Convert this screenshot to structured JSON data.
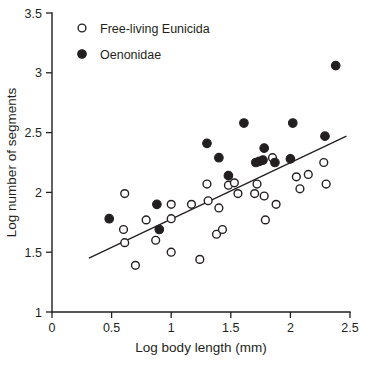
{
  "chart_data": {
    "type": "scatter",
    "title": "",
    "xlabel": "Log body length (mm)",
    "ylabel": "Log number of segments",
    "xlim": [
      0,
      2.5
    ],
    "ylim": [
      1,
      3.5
    ],
    "xticks": [
      "0",
      "0.5",
      "1",
      "1.5",
      "2",
      "2.5"
    ],
    "xtick_values": [
      0,
      0.5,
      1,
      1.5,
      2,
      2.5
    ],
    "yticks": [
      "1",
      "1.5",
      "2",
      "2.5",
      "3",
      "3.5"
    ],
    "ytick_values": [
      1,
      1.5,
      2,
      2.5,
      3,
      3.5
    ],
    "grid": false,
    "legend_position": "top-left",
    "legend": [
      {
        "label": "Free-living Eunicida",
        "marker": "open-circle"
      },
      {
        "label": "Oenonidae",
        "marker": "filled-circle"
      }
    ],
    "series": [
      {
        "name": "Free-living Eunicida",
        "marker": "open-circle",
        "points": [
          [
            0.61,
            1.99
          ],
          [
            0.6,
            1.69
          ],
          [
            0.61,
            1.58
          ],
          [
            0.7,
            1.39
          ],
          [
            0.79,
            1.77
          ],
          [
            0.87,
            1.6
          ],
          [
            1.0,
            1.9
          ],
          [
            1.0,
            1.78
          ],
          [
            1.0,
            1.5
          ],
          [
            1.17,
            1.9
          ],
          [
            1.24,
            1.44
          ],
          [
            1.3,
            2.07
          ],
          [
            1.31,
            1.93
          ],
          [
            1.38,
            1.65
          ],
          [
            1.4,
            1.87
          ],
          [
            1.43,
            1.69
          ],
          [
            1.48,
            2.06
          ],
          [
            1.53,
            2.08
          ],
          [
            1.56,
            1.99
          ],
          [
            1.7,
            1.99
          ],
          [
            1.72,
            2.07
          ],
          [
            1.78,
            1.97
          ],
          [
            1.79,
            1.77
          ],
          [
            1.85,
            2.29
          ],
          [
            1.88,
            1.9
          ],
          [
            2.05,
            2.13
          ],
          [
            2.08,
            2.03
          ],
          [
            2.15,
            2.15
          ],
          [
            2.28,
            2.25
          ],
          [
            2.3,
            2.07
          ]
        ]
      },
      {
        "name": "Oenonidae",
        "marker": "filled-circle",
        "points": [
          [
            0.48,
            1.78
          ],
          [
            0.88,
            1.9
          ],
          [
            0.9,
            1.69
          ],
          [
            1.3,
            2.41
          ],
          [
            1.4,
            2.29
          ],
          [
            1.48,
            2.14
          ],
          [
            1.61,
            2.58
          ],
          [
            1.71,
            2.25
          ],
          [
            1.74,
            2.26
          ],
          [
            1.77,
            2.27
          ],
          [
            1.78,
            2.37
          ],
          [
            1.87,
            2.25
          ],
          [
            2.0,
            2.28
          ],
          [
            2.02,
            2.58
          ],
          [
            2.29,
            2.47
          ],
          [
            2.38,
            3.06
          ]
        ]
      }
    ],
    "trendline": {
      "x_start": 0.31,
      "y_start": 1.45,
      "x_end": 2.47,
      "y_end": 2.47
    }
  }
}
